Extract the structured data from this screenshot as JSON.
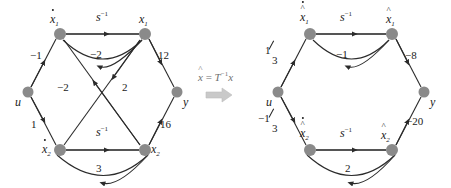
{
  "figure": {
    "kind": "signal-flow-graph-pair",
    "node_color": "#808080",
    "edge_color": "#333333",
    "arrow_glyph": "solid-triangle"
  },
  "transform": {
    "equation_lhs": "x̂",
    "equation_eq": "=",
    "equation_rhs_T": "T",
    "equation_rhs_exp": "−1",
    "equation_rhs_x": "x",
    "arrow_name": "right-arrow"
  },
  "left_graph": {
    "name": "original-state-flow-graph",
    "nodes": [
      {
        "id": "xd1",
        "label_base": "x",
        "label_sub": "1",
        "accent": "dot",
        "x": 60,
        "y": 34
      },
      {
        "id": "x1",
        "label_base": "x",
        "label_sub": "1",
        "accent": "none",
        "x": 145,
        "y": 34
      },
      {
        "id": "u",
        "label_base": "u",
        "label_sub": "",
        "accent": "none",
        "x": 28,
        "y": 92
      },
      {
        "id": "y",
        "label_base": "y",
        "label_sub": "",
        "accent": "none",
        "x": 177,
        "y": 92
      },
      {
        "id": "xd2",
        "label_base": "x",
        "label_sub": "2",
        "accent": "dot",
        "x": 60,
        "y": 150
      },
      {
        "id": "x2",
        "label_base": "x",
        "label_sub": "2",
        "accent": "none",
        "x": 145,
        "y": 150
      }
    ],
    "edges": [
      {
        "from": "xd1",
        "to": "x1",
        "label": "s",
        "exp": "−1",
        "kind": "integrator-top"
      },
      {
        "from": "x1",
        "to": "xd1",
        "label": "−2",
        "exp": "",
        "kind": "feedback-top"
      },
      {
        "from": "u",
        "to": "xd1",
        "label": "−1",
        "exp": "",
        "kind": "input-upper"
      },
      {
        "from": "u",
        "to": "xd2",
        "label": "1",
        "exp": "",
        "kind": "input-lower"
      },
      {
        "from": "x1",
        "to": "y",
        "label": "12",
        "exp": "",
        "kind": "output-upper"
      },
      {
        "from": "x2",
        "to": "y",
        "label": "16",
        "exp": "",
        "kind": "output-lower"
      },
      {
        "from": "x2",
        "to": "xd1",
        "label": "−2",
        "exp": "",
        "kind": "cross-up"
      },
      {
        "from": "x1",
        "to": "xd2",
        "label": "2",
        "exp": "",
        "kind": "cross-down"
      },
      {
        "from": "xd2",
        "to": "x2",
        "label": "s",
        "exp": "−1",
        "kind": "integrator-bottom"
      },
      {
        "from": "x2",
        "to": "xd2",
        "label": "3",
        "exp": "",
        "kind": "feedback-bottom"
      }
    ]
  },
  "right_graph": {
    "name": "transformed-state-flow-graph",
    "nodes": [
      {
        "id": "xhd1",
        "label_base": "x",
        "label_sub": "1",
        "accent": "dot-hat",
        "x": 310,
        "y": 34
      },
      {
        "id": "xh1",
        "label_base": "x",
        "label_sub": "1",
        "accent": "hat",
        "x": 392,
        "y": 34
      },
      {
        "id": "u",
        "label_base": "u",
        "label_sub": "",
        "accent": "none",
        "x": 278,
        "y": 92
      },
      {
        "id": "y",
        "label_base": "y",
        "label_sub": "",
        "accent": "none",
        "x": 424,
        "y": 92
      },
      {
        "id": "xhd2",
        "label_base": "x",
        "label_sub": "2",
        "accent": "dot-hat",
        "x": 310,
        "y": 150
      },
      {
        "id": "xh2",
        "label_base": "x",
        "label_sub": "2",
        "accent": "hat",
        "x": 392,
        "y": 150
      }
    ],
    "edges": [
      {
        "from": "xhd1",
        "to": "xh1",
        "label": "s",
        "exp": "−1",
        "kind": "integrator-top"
      },
      {
        "from": "xh1",
        "to": "xhd1",
        "label": "−1",
        "exp": "",
        "kind": "feedback-top"
      },
      {
        "from": "u",
        "to": "xhd1",
        "label": "1/3",
        "exp": "",
        "kind": "input-upper",
        "numerator": "1",
        "denominator": "3"
      },
      {
        "from": "u",
        "to": "xhd2",
        "label": "−1/3",
        "exp": "",
        "kind": "input-lower",
        "numerator": "−1",
        "denominator": "3"
      },
      {
        "from": "xh1",
        "to": "y",
        "label": "−8",
        "exp": "",
        "kind": "output-upper"
      },
      {
        "from": "xh2",
        "to": "y",
        "label": "−20",
        "exp": "",
        "kind": "output-lower"
      },
      {
        "from": "xhd2",
        "to": "xh2",
        "label": "s",
        "exp": "−1",
        "kind": "integrator-bottom"
      },
      {
        "from": "xh2",
        "to": "xhd2",
        "label": "2",
        "exp": "",
        "kind": "feedback-bottom"
      }
    ]
  }
}
